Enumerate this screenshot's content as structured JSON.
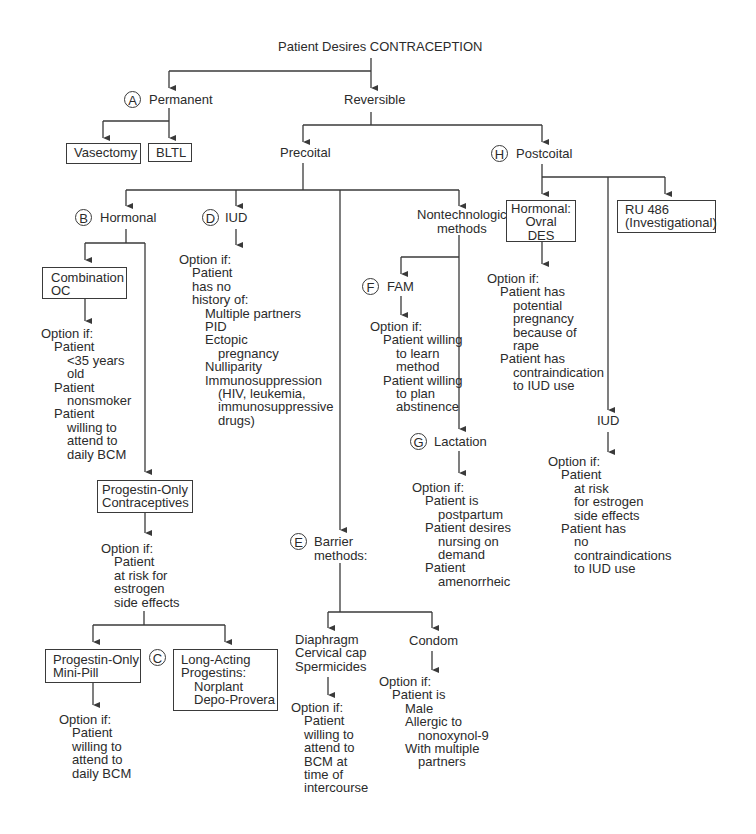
{
  "title": "Patient Desires CONTRACEPTION",
  "colors": {
    "line": "#3a3a3a",
    "text": "#2b2b2b",
    "background": "#ffffff"
  },
  "nodes": {
    "permanent": {
      "marker": "A",
      "label": "Permanent"
    },
    "reversible": {
      "label": "Reversible"
    },
    "vasectomy": {
      "label": "Vasectomy"
    },
    "bltl": {
      "label": "BLTL"
    },
    "precoital": {
      "label": "Precoital"
    },
    "postcoital": {
      "marker": "H",
      "label": "Postcoital"
    },
    "hormonal": {
      "marker": "B",
      "label": "Hormonal"
    },
    "iud": {
      "marker": "D",
      "label": "IUD"
    },
    "nontechnologic": {
      "label_line1": "Nontechnologic",
      "label_line2": "methods"
    },
    "combination_oc": {
      "label_line1": "Combination",
      "label_line2": "OC"
    },
    "progestin_only": {
      "label_line1": "Progestin-Only",
      "label_line2": "Contraceptives"
    },
    "mini_pill": {
      "label_line1": "Progestin-Only",
      "label_line2": "Mini-Pill"
    },
    "long_acting": {
      "marker": "C",
      "lines": [
        "Long-Acting",
        "Progestins:",
        "Norplant",
        "Depo-Provera"
      ]
    },
    "fam": {
      "marker": "F",
      "label": "FAM"
    },
    "lactation": {
      "marker": "G",
      "label": "Lactation"
    },
    "barrier": {
      "marker": "E",
      "label_line1": "Barrier",
      "label_line2": "methods:"
    },
    "diaphragm_group": {
      "lines": [
        "Diaphragm",
        "Cervical cap",
        "Spermicides"
      ]
    },
    "condom": {
      "label": "Condom"
    },
    "post_hormonal": {
      "lines": [
        "Hormonal:",
        "Ovral",
        "DES"
      ]
    },
    "ru486": {
      "label_line1": "RU 486",
      "label_line2": "(Investigational)"
    },
    "post_iud": {
      "label": "IUD"
    }
  },
  "criteria": {
    "combination_oc": [
      {
        "text": "Option if:",
        "indent": 0
      },
      {
        "text": "Patient",
        "indent": 1
      },
      {
        "text": "<35 years",
        "indent": 2
      },
      {
        "text": "old",
        "indent": 2
      },
      {
        "text": "Patient",
        "indent": 1
      },
      {
        "text": "nonsmoker",
        "indent": 2
      },
      {
        "text": "Patient",
        "indent": 1
      },
      {
        "text": "willing to",
        "indent": 2
      },
      {
        "text": "attend to",
        "indent": 2
      },
      {
        "text": "daily BCM",
        "indent": 2
      }
    ],
    "iud": [
      {
        "text": "Option if:",
        "indent": 0
      },
      {
        "text": "Patient",
        "indent": 1
      },
      {
        "text": "has no",
        "indent": 1
      },
      {
        "text": "history of:",
        "indent": 1
      },
      {
        "text": "Multiple partners",
        "indent": 2
      },
      {
        "text": "PID",
        "indent": 2
      },
      {
        "text": "Ectopic",
        "indent": 2
      },
      {
        "text": "pregnancy",
        "indent": 3
      },
      {
        "text": "Nulliparity",
        "indent": 2
      },
      {
        "text": "Immunosuppression",
        "indent": 2
      },
      {
        "text": "(HIV, leukemia,",
        "indent": 3
      },
      {
        "text": "immunosuppressive",
        "indent": 3
      },
      {
        "text": "drugs)",
        "indent": 3
      }
    ],
    "fam": [
      {
        "text": "Option if:",
        "indent": 0
      },
      {
        "text": "Patient willing",
        "indent": 1
      },
      {
        "text": "to learn",
        "indent": 2
      },
      {
        "text": "method",
        "indent": 2
      },
      {
        "text": "Patient willing",
        "indent": 1
      },
      {
        "text": "to plan",
        "indent": 2
      },
      {
        "text": "abstinence",
        "indent": 2
      }
    ],
    "post_hormonal": [
      {
        "text": "Option if:",
        "indent": 0
      },
      {
        "text": "Patient has",
        "indent": 1
      },
      {
        "text": "potential",
        "indent": 2
      },
      {
        "text": "pregnancy",
        "indent": 2
      },
      {
        "text": "because of",
        "indent": 2
      },
      {
        "text": "rape",
        "indent": 2
      },
      {
        "text": "Patient has",
        "indent": 1
      },
      {
        "text": "contraindication",
        "indent": 2
      },
      {
        "text": "to IUD use",
        "indent": 2
      }
    ],
    "progestin_only": [
      {
        "text": "Option if:",
        "indent": 0
      },
      {
        "text": "Patient",
        "indent": 1
      },
      {
        "text": "at risk for",
        "indent": 1
      },
      {
        "text": "estrogen",
        "indent": 1
      },
      {
        "text": "side effects",
        "indent": 1
      }
    ],
    "lactation": [
      {
        "text": "Option if:",
        "indent": 0
      },
      {
        "text": "Patient is",
        "indent": 1
      },
      {
        "text": "postpartum",
        "indent": 2
      },
      {
        "text": "Patient desires",
        "indent": 1
      },
      {
        "text": "nursing on",
        "indent": 2
      },
      {
        "text": "demand",
        "indent": 2
      },
      {
        "text": "Patient",
        "indent": 1
      },
      {
        "text": "amenorrheic",
        "indent": 2
      }
    ],
    "post_iud": [
      {
        "text": "Option if:",
        "indent": 0
      },
      {
        "text": "Patient",
        "indent": 1
      },
      {
        "text": "at risk",
        "indent": 2
      },
      {
        "text": "for estrogen",
        "indent": 2
      },
      {
        "text": "side effects",
        "indent": 2
      },
      {
        "text": "Patient has",
        "indent": 1
      },
      {
        "text": "no",
        "indent": 2
      },
      {
        "text": "contraindications",
        "indent": 2
      },
      {
        "text": "to IUD use",
        "indent": 2
      }
    ],
    "mini_pill": [
      {
        "text": "Option if:",
        "indent": 0
      },
      {
        "text": "Patient",
        "indent": 1
      },
      {
        "text": "willing to",
        "indent": 1
      },
      {
        "text": "attend to",
        "indent": 1
      },
      {
        "text": "daily BCM",
        "indent": 1
      }
    ],
    "diaphragm_group": [
      {
        "text": "Option if:",
        "indent": 0
      },
      {
        "text": "Patient",
        "indent": 1
      },
      {
        "text": "willing to",
        "indent": 1
      },
      {
        "text": "attend to",
        "indent": 1
      },
      {
        "text": "BCM at",
        "indent": 1
      },
      {
        "text": "time of",
        "indent": 1
      },
      {
        "text": "intercourse",
        "indent": 1
      }
    ],
    "condom": [
      {
        "text": "Option if:",
        "indent": 0
      },
      {
        "text": "Patient is",
        "indent": 1
      },
      {
        "text": "Male",
        "indent": 2
      },
      {
        "text": "Allergic to",
        "indent": 2
      },
      {
        "text": "nonoxynol-9",
        "indent": 3
      },
      {
        "text": "With multiple",
        "indent": 2
      },
      {
        "text": "partners",
        "indent": 3
      }
    ]
  }
}
